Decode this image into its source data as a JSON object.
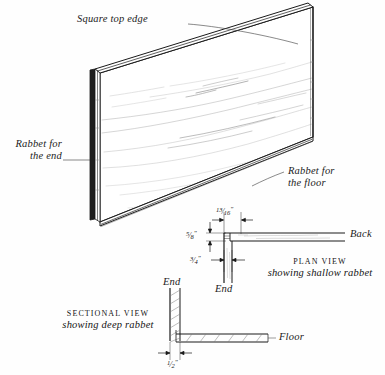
{
  "figure": {
    "type": "technical-woodworking-illustration"
  },
  "callouts": {
    "square_top_edge": "Square top edge",
    "rabbet_for_end_line1": "Rabbet for",
    "rabbet_for_end_line2": "the end",
    "rabbet_for_floor_line1": "Rabbet for",
    "rabbet_for_floor_line2": "the floor"
  },
  "plan_view": {
    "title": "PLAN VIEW",
    "subtitle": "showing shallow rabbet",
    "part_back": "Back",
    "part_end": "End",
    "dim_width": {
      "whole": "",
      "num": "13",
      "den": "16",
      "unit": "\""
    },
    "dim_depth": {
      "whole": "",
      "num": "5",
      "den": "8",
      "unit": "\""
    },
    "dim_thickness": {
      "whole": "",
      "num": "3",
      "den": "4",
      "unit": "\""
    }
  },
  "sectional_view": {
    "title": "SECTIONAL VIEW",
    "subtitle": "showing deep rabbet",
    "part_end": "End",
    "part_floor": "Floor",
    "dim_depth": {
      "whole": "",
      "num": "1",
      "den": "2",
      "unit": "\""
    }
  },
  "colors": {
    "ink": "#1a1a1a",
    "paper": "#fefefe",
    "grain": "#a9a9a9",
    "hatch": "#6f6f6f"
  }
}
